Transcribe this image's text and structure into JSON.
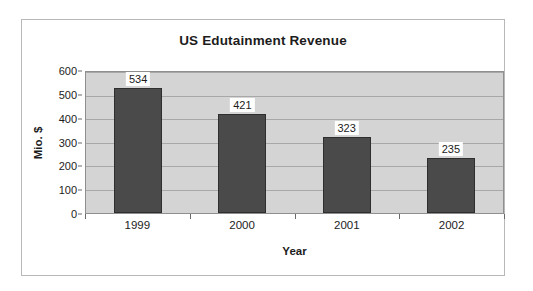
{
  "chart_data": {
    "type": "bar",
    "title": "US Edutainment Revenue",
    "xlabel": "Year",
    "ylabel": "Mio. $",
    "categories": [
      "1999",
      "2000",
      "2001",
      "2002"
    ],
    "values": [
      534,
      421,
      323,
      235
    ],
    "data_labels": [
      "534",
      "421",
      "323",
      "235"
    ],
    "ylim": [
      0,
      600
    ],
    "ytick_labels": [
      "600",
      "500",
      "400",
      "300",
      "200",
      "100",
      "0"
    ],
    "ytick_values": [
      600,
      500,
      400,
      300,
      200,
      100,
      0
    ],
    "grid": true,
    "legend": "none",
    "series": [
      {
        "name": "US Edutainment Revenue",
        "values": [
          534,
          421,
          323,
          235
        ]
      }
    ],
    "colors": {
      "bar_fill": "#4a4a4a",
      "bar_border": "#2e2e2e",
      "plot_background": "#d4d4d4",
      "gridline": "#a8a8a8",
      "chart_background": "#ffffff",
      "frame_border": "#b8b8b8",
      "axis_line": "#8f8f8f",
      "text": "#1c1c1c",
      "label_background": "#ffffff"
    }
  }
}
